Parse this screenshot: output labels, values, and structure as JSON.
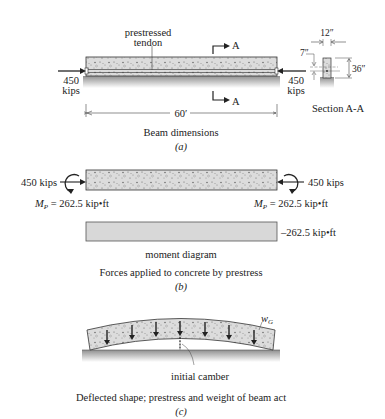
{
  "panel_a": {
    "tendon_label_line1": "prestressed",
    "tendon_label_line2": "tendon",
    "section_marker": "A",
    "left_force_value": "450",
    "left_force_unit": "kips",
    "right_force_value": "450",
    "right_force_unit": "kips",
    "span_length": "60′",
    "section_width": "12″",
    "section_depth": "36″",
    "tendon_eccentricity": "7″",
    "section_title": "Section A-A",
    "caption": "Beam dimensions",
    "tag": "(a)"
  },
  "panel_b": {
    "left_force": "450 kips",
    "right_force": "450 kips",
    "left_moment_symbol": "M",
    "left_moment_sub": "P",
    "left_moment_value": " = 262.5 kip•ft",
    "right_moment_symbol": "M",
    "right_moment_sub": "P",
    "right_moment_value": " = 262.5 kip•ft",
    "moment_diagram_value": "–262.5 kip•ft",
    "moment_diagram_label": "moment diagram",
    "caption": "Forces applied to concrete by prestress",
    "tag": "(b)"
  },
  "panel_c": {
    "load_symbol": "w",
    "load_sub": "G",
    "camber_label": "initial camber",
    "caption": "Deflected shape; prestress and weight of beam act",
    "tag": "(c)"
  },
  "colors": {
    "concrete": "#d9d9d9",
    "ground_top": "#9a9a9a",
    "ground_bottom": "#ffffff",
    "line": "#222222"
  }
}
